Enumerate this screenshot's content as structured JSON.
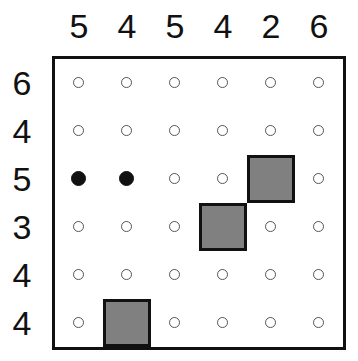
{
  "puzzle": {
    "size": 6,
    "column_clues": [
      "5",
      "4",
      "5",
      "4",
      "2",
      "6"
    ],
    "row_clues": [
      "6",
      "4",
      "5",
      "3",
      "4",
      "4"
    ],
    "grid": [
      [
        "empty",
        "empty",
        "empty",
        "empty",
        "empty",
        "empty"
      ],
      [
        "empty",
        "empty",
        "empty",
        "empty",
        "empty",
        "empty"
      ],
      [
        "filled",
        "filled",
        "empty",
        "empty",
        "block",
        "empty"
      ],
      [
        "empty",
        "empty",
        "empty",
        "block",
        "empty",
        "empty"
      ],
      [
        "empty",
        "empty",
        "empty",
        "empty",
        "empty",
        "empty"
      ],
      [
        "empty",
        "block",
        "empty",
        "empty",
        "empty",
        "empty"
      ]
    ],
    "colors": {
      "block": "#808080",
      "border": "#111111",
      "dot_filled": "#111111"
    }
  }
}
